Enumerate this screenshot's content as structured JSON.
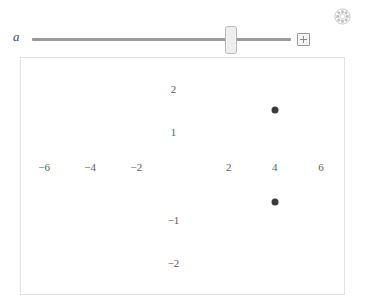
{
  "app": {
    "slider": {
      "variable_label": "a",
      "add_button_icon": "plus-icon",
      "thumb_position_percent": 78
    },
    "settings_icon": "gear-icon"
  },
  "chart_data": {
    "type": "scatter",
    "title": "",
    "xlabel": "",
    "ylabel": "",
    "grid": false,
    "legend": null,
    "xlim": [
      -7,
      7
    ],
    "ylim": [
      -2.7,
      2.7
    ],
    "x_tick_labels": [
      "-6",
      "-4",
      "-2",
      "2",
      "4",
      "6"
    ],
    "x_tick_values": [
      -6,
      -4,
      -2,
      2,
      4,
      6
    ],
    "y_tick_labels": [
      "2",
      "1",
      "-1",
      "-2"
    ],
    "y_tick_values": [
      2,
      1,
      -1,
      -2
    ],
    "point_color": "#3b3b3b",
    "points": [
      {
        "x": 4,
        "y": 1.5
      },
      {
        "x": 4,
        "y": -0.6
      }
    ]
  }
}
